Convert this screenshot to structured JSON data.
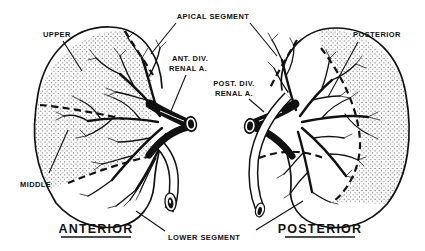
{
  "figure": {
    "type": "anatomical-line-diagram",
    "colors": {
      "ink": "#111111",
      "background": "#ffffff"
    },
    "left_view": {
      "title": "ANTERIOR",
      "labels": {
        "upper": "UPPER",
        "middle": "MIDDLE",
        "ant_div_line1": "ANT. DIV.",
        "ant_div_line2": "RENAL A."
      }
    },
    "right_view": {
      "title": "POSTERIOR",
      "labels": {
        "posterior_segment": "POSTERIOR",
        "post_div_line1": "POST. DIV.",
        "post_div_line2": "RENAL A."
      }
    },
    "shared_labels": {
      "apical_segment": "APICAL SEGMENT",
      "lower_segment": "LOWER SEGMENT"
    }
  }
}
